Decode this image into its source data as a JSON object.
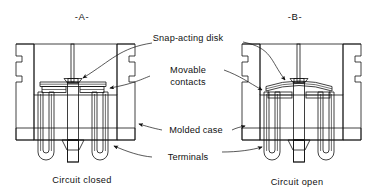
{
  "figure": {
    "type": "technical-cutaway-diagram",
    "panels": [
      {
        "id": "A",
        "panel_label": "-A-",
        "caption": "Circuit closed",
        "disk_state": "flat / snapped down",
        "contacts_state": "closed (touching)"
      },
      {
        "id": "B",
        "panel_label": "-B-",
        "caption": "Circuit open",
        "disk_state": "bowed / snapped up",
        "contacts_state": "open (separated)"
      }
    ],
    "callouts": [
      {
        "id": "snap-acting-disk",
        "label": "Snap-acting disk"
      },
      {
        "id": "movable-contacts",
        "label_line1": "Movable",
        "label_line2": "contacts"
      },
      {
        "id": "molded-case",
        "label": "Molded case"
      },
      {
        "id": "terminals",
        "label": "Terminals"
      }
    ],
    "colors": {
      "line": "#111111",
      "background": "#ffffff",
      "hatch": "#111111",
      "metal_fill": "#b8b8b8",
      "disk_fill": "#d8d8d8",
      "contact_fill": "#2a2a2a"
    }
  }
}
